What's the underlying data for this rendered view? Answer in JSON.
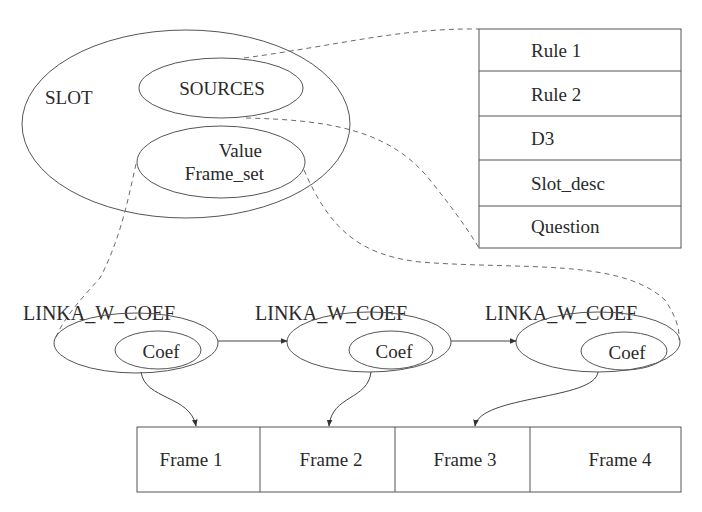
{
  "diagram": {
    "slot": {
      "label": "SLOT",
      "sources_label": "SOURCES",
      "value_label_line1": "Value",
      "value_label_line2": "Frame_set"
    },
    "sources_table": {
      "rows": [
        "Rule 1",
        "Rule 2",
        "D3",
        "Slot_desc",
        "Question"
      ]
    },
    "link_nodes": [
      {
        "label": "LINKA_W_COEF",
        "inner_label": "Coef",
        "points_to": "Frame 1"
      },
      {
        "label": "LINKA_W_COEF",
        "inner_label": "Coef",
        "points_to": "Frame 2"
      },
      {
        "label": "LINKA_W_COEF",
        "inner_label": "Coef",
        "points_to": "Frame 3"
      }
    ],
    "frames": [
      "Frame 1",
      "Frame 2",
      "Frame 3",
      "Frame 4"
    ],
    "colors": {
      "line": "#555555",
      "dashed_line": "#6a6a6a",
      "text": "#2a2a2a",
      "background": "#ffffff"
    }
  }
}
